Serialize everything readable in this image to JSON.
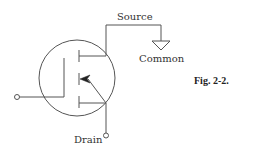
{
  "diagram": {
    "type": "circuit-schematic",
    "component": "MOSFET transistor symbol",
    "labels": {
      "source": "Source",
      "common": "Common",
      "drain": "Drain",
      "figure": "Fig. 2-2."
    },
    "terminals": [
      "gate",
      "source",
      "drain"
    ],
    "connections": [
      {
        "from": "source",
        "to": "common",
        "symbol": "ground"
      },
      {
        "from": "drain",
        "to": "drain-terminal"
      },
      {
        "from": "gate",
        "to": "gate-terminal"
      }
    ],
    "colors": {
      "stroke": "#555555",
      "text": "#333333"
    }
  }
}
